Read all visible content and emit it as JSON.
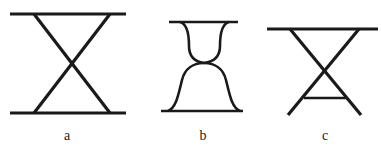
{
  "diagram": {
    "stroke_color": "#1a1a1a",
    "background": "#ffffff",
    "figures": [
      {
        "id": "a",
        "label": "a",
        "description": "Two horizontal bars joined by a full X of crossing diagonals"
      },
      {
        "id": "b",
        "label": "b",
        "description": "Two horizontal bars joined by curved hourglass-shaped sides meeting at a waist"
      },
      {
        "id": "c",
        "label": "c",
        "description": "Top horizontal bar with crossing diagonal legs and a short lower crossbar"
      }
    ]
  }
}
